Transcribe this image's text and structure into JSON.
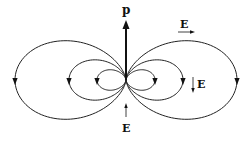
{
  "diagram": {
    "dipole_label": "p",
    "field_labels": {
      "top_right": "E",
      "right": "E",
      "bottom": "E"
    },
    "field_line_scales": [
      29,
      57,
      111
    ],
    "colors": {
      "line": "#222222",
      "background": "#ffffff"
    }
  }
}
